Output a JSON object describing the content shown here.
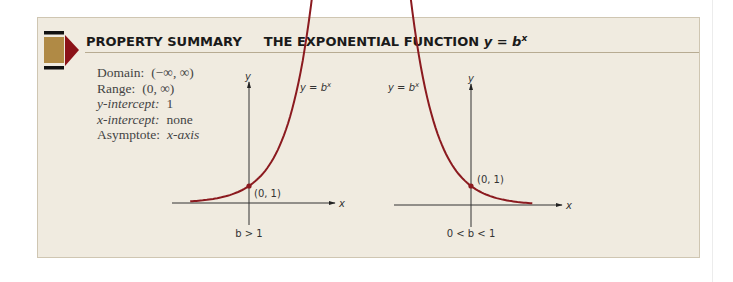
{
  "header": {
    "label": "PROPERTY SUMMARY",
    "title": "THE EXPONENTIAL FUNCTION",
    "equation_base": "y = b",
    "equation_exp": "x"
  },
  "properties": [
    {
      "label": "Domain:",
      "value": "(−∞, ∞)"
    },
    {
      "label": "Range:",
      "value": "(0, ∞)"
    },
    {
      "label": "y-intercept:",
      "value": "1"
    },
    {
      "label": "x-intercept:",
      "value": "none"
    },
    {
      "label": "Asymptote:",
      "value": "x-axis"
    }
  ],
  "graphs": [
    {
      "condition": "b > 1",
      "curve_label_base": "y = b",
      "curve_label_exp": "x",
      "point_label": "(0, 1)",
      "x_axis_label": "x",
      "y_axis_label": "y",
      "behavior": "increasing"
    },
    {
      "condition": "0 < b < 1",
      "curve_label_base": "y = b",
      "curve_label_exp": "x",
      "point_label": "(0, 1)",
      "x_axis_label": "x",
      "y_axis_label": "y",
      "behavior": "decreasing"
    }
  ],
  "colors": {
    "curve": "#8b1a1f",
    "icon_tan": "#b08a45",
    "icon_red": "#8b1218",
    "box_bg": "#f0ebe0"
  }
}
